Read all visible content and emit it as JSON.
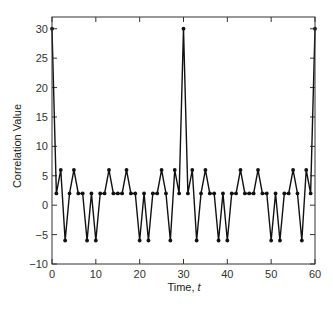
{
  "chart_data": {
    "type": "line",
    "title": "",
    "xlabel": "Time, t",
    "xlabel_parts": {
      "text": "Time, ",
      "italic": "t"
    },
    "ylabel": "Correlation Value",
    "xlim": [
      0,
      60
    ],
    "ylim": [
      -10,
      32
    ],
    "xticks": [
      0,
      10,
      20,
      30,
      40,
      50,
      60
    ],
    "yticks": [
      -10,
      -5,
      0,
      5,
      10,
      15,
      20,
      25,
      30
    ],
    "grid": false,
    "legend": null,
    "marker": "dot",
    "line_color": "#111111",
    "x": [
      0,
      1,
      2,
      3,
      4,
      5,
      6,
      7,
      8,
      9,
      10,
      11,
      12,
      13,
      14,
      15,
      16,
      17,
      18,
      19,
      20,
      21,
      22,
      23,
      24,
      25,
      26,
      27,
      28,
      29,
      30,
      31,
      32,
      33,
      34,
      35,
      36,
      37,
      38,
      39,
      40,
      41,
      42,
      43,
      44,
      45,
      46,
      47,
      48,
      49,
      50,
      51,
      52,
      53,
      54,
      55,
      56,
      57,
      58,
      59,
      60
    ],
    "series": [
      {
        "name": "Correlation",
        "values": [
          30,
          2,
          6,
          -6,
          2,
          6,
          2,
          2,
          -6,
          2,
          -6,
          2,
          2,
          6,
          2,
          2,
          2,
          6,
          2,
          2,
          -6,
          2,
          -6,
          2,
          2,
          6,
          2,
          -6,
          6,
          2,
          30,
          2,
          6,
          -6,
          2,
          6,
          2,
          2,
          -6,
          2,
          -6,
          2,
          2,
          6,
          2,
          2,
          2,
          6,
          2,
          2,
          -6,
          2,
          -6,
          2,
          2,
          6,
          2,
          -6,
          6,
          2,
          30
        ]
      }
    ]
  }
}
